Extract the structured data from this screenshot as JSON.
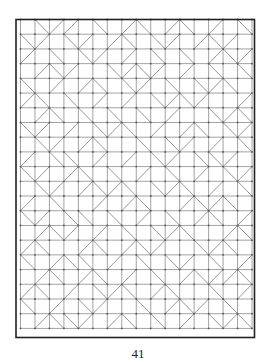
{
  "page": {
    "number": "41"
  },
  "figure": {
    "type": "tiling-pattern",
    "columns": 16,
    "rows": 21,
    "line_color": "#8a8a8a",
    "frame_color": "#222222",
    "vertex_color": "#555555",
    "diagonals": [
      "0122010210210201",
      "1201202101202120",
      "2010120201010212",
      "0212001212020101",
      "1020210120101210",
      "2101020201212002",
      "0210101010200121",
      "1202012102021012",
      "0120210010120201",
      "2011020201201120",
      "1202101020102012",
      "0120212101210201",
      "2010020210021210",
      "1201101020102102",
      "0212020101210021",
      "2100210212001210",
      "1021102010120102",
      "0210210201021221",
      "2102012102100102",
      "1020120010212010",
      "0211202101020121"
    ]
  }
}
